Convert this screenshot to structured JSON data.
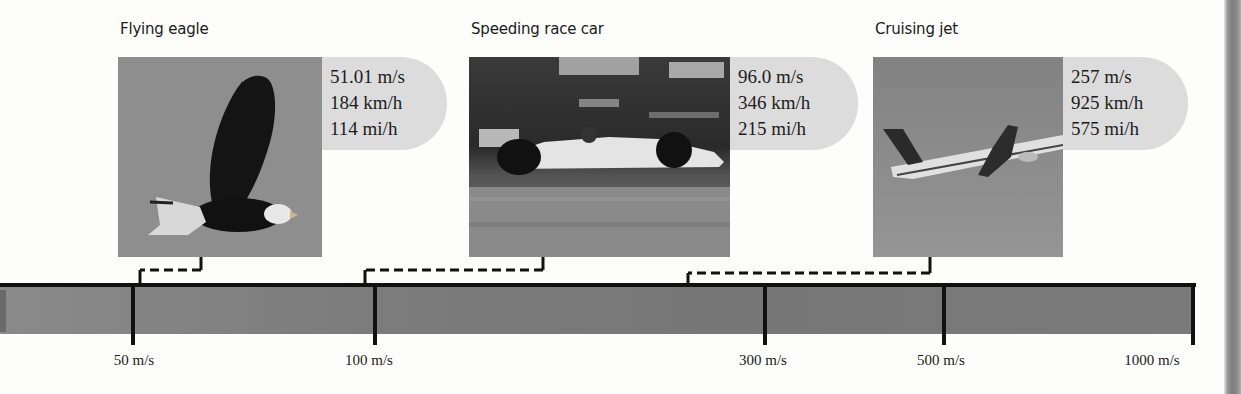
{
  "items": [
    {
      "title": "Flying eagle",
      "image": "eagle-photo",
      "speeds": [
        "51.01 m/s",
        "184 km/h",
        "114 mi/h"
      ]
    },
    {
      "title": "Speeding race car",
      "image": "race-car-photo",
      "speeds": [
        "96.0 m/s",
        "346 km/h",
        "215 mi/h"
      ]
    },
    {
      "title": "Cruising jet",
      "image": "jet-photo",
      "speeds": [
        "257 m/s",
        "925 km/h",
        "575 mi/h"
      ]
    }
  ],
  "scale": {
    "type": "logarithmic speed scale",
    "ticks": [
      "50 m/s",
      "100 m/s",
      "300 m/s",
      "500 m/s",
      "1000 m/s"
    ]
  },
  "colors": {
    "bar": "#7c7c7c",
    "speed_box": "#dcdcdc",
    "line": "#111111"
  }
}
